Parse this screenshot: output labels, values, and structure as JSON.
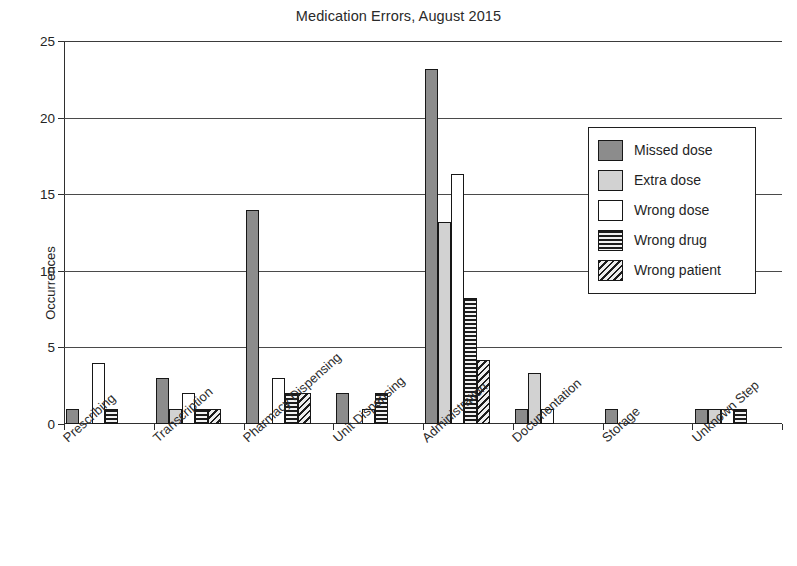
{
  "chart_data": {
    "type": "bar",
    "title": "Medication Errors, August 2015",
    "xlabel": "",
    "ylabel": "Occurrences",
    "ylim": [
      0,
      25
    ],
    "yticks": [
      0,
      5,
      10,
      15,
      20,
      25
    ],
    "grid": true,
    "legend_position": "upper right",
    "categories": [
      "Prescribing",
      "Transcription",
      "Pharmacy Dispensing",
      "Unit Dispensing",
      "Administration",
      "Documentation",
      "Storage",
      "Unknown Step"
    ],
    "series": [
      {
        "name": "Missed dose",
        "values": [
          1,
          3,
          14,
          2,
          23.2,
          1,
          1,
          1
        ]
      },
      {
        "name": "Extra dose",
        "values": [
          0,
          1,
          0,
          0,
          13.2,
          3.3,
          0,
          1
        ]
      },
      {
        "name": "Wrong dose",
        "values": [
          4,
          2,
          3,
          1,
          16.3,
          1,
          0,
          1
        ]
      },
      {
        "name": "Wrong drug",
        "values": [
          1,
          1,
          2,
          2,
          8.2,
          0,
          0,
          1
        ]
      },
      {
        "name": "Wrong patient",
        "values": [
          0,
          1,
          2,
          0,
          4.2,
          0,
          0,
          0
        ]
      }
    ]
  },
  "legend": {
    "items": [
      {
        "label": "Missed dose",
        "swatch": "dark-gray-solid",
        "color": "#8c8c8c"
      },
      {
        "label": "Extra dose",
        "swatch": "light-gray-solid",
        "color": "#d2d2d2"
      },
      {
        "label": "Wrong dose",
        "swatch": "white-solid",
        "color": "#ffffff"
      },
      {
        "label": "Wrong drug",
        "swatch": "horizontal-hatch",
        "color": "#1c1c1c"
      },
      {
        "label": "Wrong patient",
        "swatch": "diagonal-hatch",
        "color": "#1c1c1c"
      }
    ]
  },
  "axis": {
    "y_title": "Occurrences",
    "y_tick_labels": [
      "0",
      "5",
      "10",
      "15",
      "20",
      "25"
    ]
  },
  "caption": {
    "text": ""
  }
}
